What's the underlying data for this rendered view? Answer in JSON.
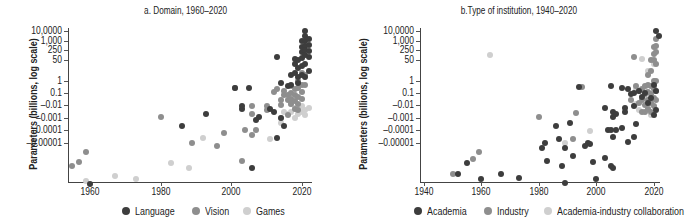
{
  "colors": {
    "dark": "#3d3d3d",
    "mid": "#8e8e8e",
    "light": "#cfcfcf"
  },
  "chart_data": [
    {
      "type": "scatter",
      "title": "a. Domain, 1960–2020",
      "xlabel": "",
      "ylabel": "Parameters (billions, log scale)",
      "x_ticks": [
        "1960",
        "1980",
        "2000",
        "2020"
      ],
      "y_ticks": [
        "10,0000",
        "1,000",
        "250",
        "50",
        "1",
        "0.1",
        "–0.01",
        "–0.001",
        "–0.0001",
        "–0.00001"
      ],
      "xlim": [
        1954,
        2023
      ],
      "grid": false,
      "legend_position": "bottom",
      "legend": [
        "Language",
        "Vision",
        "Games"
      ],
      "series": [
        {
          "name": "Language",
          "color": "#3d3d3d",
          "points": [
            [
              1960,
              -3.3
            ],
            [
              1986,
              1.3
            ],
            [
              1993,
              2.3
            ],
            [
              2001,
              4.4
            ],
            [
              2003,
              2.7
            ],
            [
              2003,
              2.9
            ],
            [
              2005,
              4.4
            ],
            [
              2006,
              -2.0
            ],
            [
              2007,
              1.8
            ],
            [
              2008,
              2.1
            ],
            [
              2011,
              2.7
            ],
            [
              2012,
              2.5
            ],
            [
              2013,
              6.3
            ],
            [
              2013,
              0.4
            ],
            [
              2014,
              4.8
            ],
            [
              2014,
              2.0
            ],
            [
              2015,
              1.3
            ],
            [
              2016,
              4.6
            ],
            [
              2017,
              5.3
            ],
            [
              2017,
              4.7
            ],
            [
              2018,
              6.1
            ],
            [
              2018,
              5.8
            ],
            [
              2018,
              5.4
            ],
            [
              2019,
              6.0
            ],
            [
              2019,
              5.6
            ],
            [
              2019,
              5.2
            ],
            [
              2019,
              4.8
            ],
            [
              2020,
              8.0
            ],
            [
              2020,
              7.3
            ],
            [
              2020,
              6.8
            ],
            [
              2020,
              6.2
            ],
            [
              2020,
              5.7
            ],
            [
              2020,
              5.3
            ],
            [
              2021,
              9.0
            ],
            [
              2021,
              8.5
            ],
            [
              2021,
              8.0
            ],
            [
              2021,
              7.4
            ],
            [
              2021,
              7.0
            ],
            [
              2021,
              6.5
            ],
            [
              2021,
              5.8
            ],
            [
              2021,
              5.2
            ],
            [
              2022,
              8.2
            ],
            [
              2022,
              7.6
            ],
            [
              2022,
              6.9
            ],
            [
              2022,
              6.3
            ],
            [
              2022,
              5.5
            ]
          ]
        },
        {
          "name": "Vision",
          "color": "#8e8e8e",
          "points": [
            [
              1955,
              -1.8
            ],
            [
              1957,
              -1.5
            ],
            [
              1959,
              -0.7
            ],
            [
              1980,
              2.1
            ],
            [
              1989,
              0.0
            ],
            [
              1996,
              -0.2
            ],
            [
              1998,
              0.8
            ],
            [
              2001,
              4.4
            ],
            [
              2003,
              -1.4
            ],
            [
              2004,
              1.0
            ],
            [
              2006,
              2.9
            ],
            [
              2006,
              2.3
            ],
            [
              2006,
              0.6
            ],
            [
              2007,
              1.0
            ],
            [
              2010,
              2.9
            ],
            [
              2010,
              2.6
            ],
            [
              2012,
              4.1
            ],
            [
              2013,
              4.3
            ],
            [
              2014,
              3.4
            ],
            [
              2014,
              3.0
            ],
            [
              2015,
              4.2
            ],
            [
              2015,
              3.8
            ],
            [
              2016,
              3.8
            ],
            [
              2016,
              3.4
            ],
            [
              2016,
              2.2
            ],
            [
              2017,
              4.6
            ],
            [
              2017,
              4.0
            ],
            [
              2017,
              3.5
            ],
            [
              2017,
              3.1
            ],
            [
              2018,
              4.3
            ],
            [
              2018,
              3.8
            ],
            [
              2018,
              3.3
            ],
            [
              2018,
              2.7
            ],
            [
              2019,
              5.0
            ],
            [
              2019,
              4.4
            ],
            [
              2019,
              3.7
            ],
            [
              2019,
              3.1
            ],
            [
              2019,
              2.6
            ],
            [
              2020,
              5.4
            ],
            [
              2020,
              4.7
            ],
            [
              2020,
              4.1
            ],
            [
              2020,
              3.5
            ],
            [
              2021,
              5.3
            ],
            [
              2021,
              4.7
            ]
          ]
        },
        {
          "name": "Games",
          "color": "#cfcfcf",
          "points": [
            [
              1959,
              -3.0
            ],
            [
              1967,
              -2.6
            ],
            [
              1973,
              -2.9
            ],
            [
              1983,
              -1.6
            ],
            [
              1988,
              -2.0
            ],
            [
              1992,
              0.4
            ],
            [
              2011,
              0.3
            ],
            [
              2014,
              2.0
            ],
            [
              2014,
              1.6
            ],
            [
              2015,
              2.5
            ],
            [
              2016,
              2.3
            ],
            [
              2017,
              3.1
            ],
            [
              2017,
              2.5
            ],
            [
              2018,
              2.0
            ],
            [
              2018,
              2.8
            ],
            [
              2019,
              2.3
            ],
            [
              2019,
              2.7
            ],
            [
              2020,
              2.9
            ],
            [
              2020,
              2.5
            ],
            [
              2021,
              2.6
            ],
            [
              2021,
              2.2
            ],
            [
              2022,
              2.8
            ]
          ]
        }
      ]
    },
    {
      "type": "scatter",
      "title": "b.Type of institution, 1940–2020",
      "xlabel": "",
      "ylabel": "Parameters (billions, log scale)",
      "x_ticks": [
        "1940",
        "1960",
        "1980",
        "2000",
        "2020"
      ],
      "y_ticks": [
        "10,0000",
        "1,000",
        "250",
        "50",
        "1",
        "0.1",
        "–0.01",
        "–0.001",
        "–0.0001",
        "–0.00001"
      ],
      "xlim": [
        1939,
        2022
      ],
      "grid": false,
      "legend_position": "bottom",
      "legend": [
        "Academia",
        "Industry",
        "Academia-industry collaboration"
      ],
      "series": [
        {
          "name": "Academia",
          "color": "#3d3d3d",
          "points": [
            [
              1952,
              -2.5
            ],
            [
              1955,
              -1.6
            ],
            [
              1960,
              -2.9
            ],
            [
              1967,
              -2.5
            ],
            [
              1973,
              -2.8
            ],
            [
              1981,
              -0.4
            ],
            [
              1982,
              0.0
            ],
            [
              1983,
              -1.4
            ],
            [
              1986,
              1.3
            ],
            [
              1987,
              0.3
            ],
            [
              1988,
              -1.8
            ],
            [
              1989,
              -0.4
            ],
            [
              1989,
              -3.2
            ],
            [
              1991,
              1.6
            ],
            [
              1992,
              -1.0
            ],
            [
              1994,
              4.5
            ],
            [
              1996,
              -0.2
            ],
            [
              1997,
              0.0
            ],
            [
              1998,
              -0.1
            ],
            [
              1999,
              -1.5
            ],
            [
              2000,
              -2.9
            ],
            [
              2003,
              2.8
            ],
            [
              2003,
              -1.2
            ],
            [
              2004,
              1.0
            ],
            [
              2005,
              4.6
            ],
            [
              2005,
              1.0
            ],
            [
              2005,
              -1.8
            ],
            [
              2006,
              2.5
            ],
            [
              2006,
              2.1
            ],
            [
              2006,
              0.5
            ],
            [
              2006,
              -2.0
            ],
            [
              2007,
              1.0
            ],
            [
              2007,
              2.3
            ],
            [
              2009,
              4.4
            ],
            [
              2009,
              1.2
            ],
            [
              2010,
              2.8
            ],
            [
              2010,
              2.5
            ],
            [
              2011,
              4.3
            ],
            [
              2011,
              0.1
            ],
            [
              2012,
              3.9
            ],
            [
              2013,
              4.0
            ],
            [
              2013,
              2.9
            ],
            [
              2013,
              0.5
            ],
            [
              2014,
              1.5
            ],
            [
              2015,
              4.2
            ],
            [
              2016,
              3.7
            ],
            [
              2017,
              4.0
            ],
            [
              2018,
              3.2
            ],
            [
              2019,
              3.6
            ],
            [
              2020,
              2.2
            ],
            [
              2020,
              4.7
            ],
            [
              2021,
              4.2
            ],
            [
              2021,
              2.6
            ],
            [
              2021,
              9.0
            ],
            [
              2022,
              8.5
            ]
          ]
        },
        {
          "name": "Industry",
          "color": "#8e8e8e",
          "points": [
            [
              1950,
              -2.5
            ],
            [
              1957,
              -1.3
            ],
            [
              1959,
              -0.7
            ],
            [
              1980,
              2.1
            ],
            [
              1992,
              0.3
            ],
            [
              1993,
              2.4
            ],
            [
              1995,
              4.5
            ],
            [
              2012,
              3.4
            ],
            [
              2013,
              6.3
            ],
            [
              2014,
              4.6
            ],
            [
              2015,
              4.2
            ],
            [
              2015,
              3.2
            ],
            [
              2016,
              4.3
            ],
            [
              2016,
              3.4
            ],
            [
              2016,
              2.5
            ],
            [
              2017,
              4.6
            ],
            [
              2017,
              3.9
            ],
            [
              2017,
              3.0
            ],
            [
              2017,
              2.5
            ],
            [
              2018,
              5.3
            ],
            [
              2018,
              4.7
            ],
            [
              2018,
              4.1
            ],
            [
              2018,
              3.4
            ],
            [
              2018,
              2.7
            ],
            [
              2019,
              6.0
            ],
            [
              2019,
              5.5
            ],
            [
              2019,
              4.6
            ],
            [
              2019,
              3.9
            ],
            [
              2019,
              3.2
            ],
            [
              2019,
              2.5
            ],
            [
              2020,
              7.3
            ],
            [
              2020,
              6.6
            ],
            [
              2020,
              6.0
            ],
            [
              2020,
              5.0
            ],
            [
              2020,
              4.3
            ],
            [
              2020,
              3.6
            ],
            [
              2020,
              2.9
            ],
            [
              2021,
              8.2
            ],
            [
              2021,
              7.5
            ],
            [
              2021,
              6.8
            ],
            [
              2021,
              5.8
            ],
            [
              2021,
              5.0
            ],
            [
              2021,
              4.2
            ],
            [
              2021,
              3.4
            ]
          ]
        },
        {
          "name": "Academia-industry collaboration",
          "color": "#cfcfcf",
          "points": [
            [
              1963,
              6.5
            ],
            [
              1989,
              0.0
            ],
            [
              1998,
              0.9
            ],
            [
              2014,
              4.3
            ],
            [
              2014,
              3.1
            ],
            [
              2015,
              2.6
            ],
            [
              2016,
              6.1
            ],
            [
              2017,
              4.5
            ],
            [
              2017,
              3.6
            ],
            [
              2018,
              5.5
            ],
            [
              2018,
              2.8
            ],
            [
              2019,
              3.2
            ],
            [
              2019,
              2.2
            ],
            [
              2020,
              5.8
            ],
            [
              2020,
              4.5
            ]
          ]
        }
      ]
    }
  ]
}
